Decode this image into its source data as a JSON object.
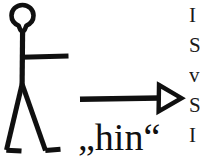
{
  "illustration": {
    "title": "stick figure with direction arrow",
    "background_color": "#ffffff",
    "ink_color": "#101010",
    "caption": "„hin“",
    "caption_text_plain": "hin",
    "quote_style": "german-low-high-double-quotes",
    "stick_figure": {
      "name": "stick-figure-person",
      "parts": [
        "head",
        "body",
        "arm",
        "left-leg",
        "right-leg",
        "left-foot",
        "right-foot"
      ],
      "arm_direction": "right"
    },
    "arrow": {
      "name": "right-arrow",
      "direction": "right",
      "head_style": "hollow-outline-triangle"
    },
    "edge_text_fragments": [
      "I",
      "S",
      "v",
      "S",
      "I"
    ]
  }
}
